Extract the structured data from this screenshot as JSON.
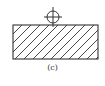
{
  "figure": {
    "caption": "(c)",
    "stroke_color": "#333333",
    "block": {
      "x": 13,
      "y": 25,
      "width": 85,
      "height": 34,
      "hatch_spacing": 9
    },
    "symbol": {
      "type": "circle-crosshair",
      "cx": 53,
      "cy": 17,
      "r": 6
    }
  }
}
